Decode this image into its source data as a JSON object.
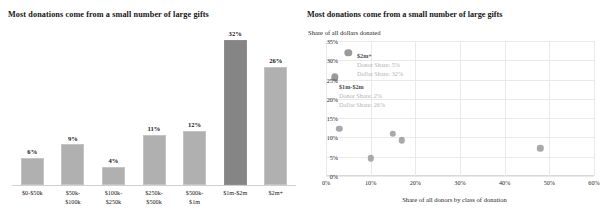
{
  "bar_panel": {
    "title": "Most donations come from a small number of large gifts"
  },
  "scatter_panel": {
    "title": "Most donations come from a small number of large gifts",
    "ylabel": "Share of all dollars donated",
    "xlabel": "Share of all donors by class of donation",
    "annotations": [
      {
        "header": "$2m+",
        "line1": "Donor Share: 5%",
        "line2": "Dollar Share: 32%"
      },
      {
        "header": "$1m-$2m",
        "line1": "Donor Share: 2%",
        "line2": "Dollar Share: 26%"
      }
    ]
  },
  "colors": {
    "bar_light": "#b0b0b0",
    "bar_dark": "#858585",
    "dot": "#a9a9a9",
    "grid": "#e9e9e9",
    "annotation_text": "#b4b4b4"
  },
  "chart_data": [
    {
      "type": "bar",
      "title": "Most donations come from a small number of large gifts",
      "xlabel": "",
      "ylabel": "",
      "categories": [
        "$0-$50k",
        "$50k-\n$100k",
        "$100k-\n$250k",
        "$250k-\n$500k",
        "$500k-\n$1m",
        "$1m-$2m",
        "$2m+"
      ],
      "values": [
        6,
        9,
        4,
        11,
        12,
        32,
        26
      ],
      "value_labels": [
        "6%",
        "9%",
        "4%",
        "11%",
        "12%",
        "32%",
        "26%"
      ],
      "highlighted_index": 5,
      "ylim": [
        0,
        35
      ],
      "grid": false,
      "legend": "none"
    },
    {
      "type": "scatter",
      "title": "Most donations come from a small number of large gifts",
      "xlabel": "Share of all donors by class of donation",
      "ylabel": "Share of all dollars donated",
      "xlim": [
        0,
        60
      ],
      "ylim": [
        0,
        35
      ],
      "xticks": [
        "0%",
        "10%",
        "20%",
        "30%",
        "40%",
        "50%",
        "60%"
      ],
      "xtick_values": [
        0,
        10,
        20,
        30,
        40,
        50,
        60
      ],
      "yticks": [
        "0%",
        "5%",
        "10%",
        "15%",
        "20%",
        "25%",
        "30%",
        "35%"
      ],
      "ytick_values": [
        0,
        5,
        10,
        15,
        20,
        25,
        30,
        35
      ],
      "grid": true,
      "legend": "none",
      "points": [
        {
          "label": "$2m+",
          "x": 5,
          "y": 32,
          "size": 7.4
        },
        {
          "label": "$1m-$2m",
          "x": 2,
          "y": 25.6,
          "size": 7.4
        },
        {
          "label": "$500k-$1m",
          "x": 3,
          "y": 12.3,
          "size": 6.4
        },
        {
          "label": "$250k-$500k",
          "x": 10,
          "y": 4.6,
          "size": 6.4
        },
        {
          "label": "$100k-$250k",
          "x": 15,
          "y": 11.0,
          "size": 6.4
        },
        {
          "label": "$50k-$100k",
          "x": 17,
          "y": 9.3,
          "size": 6.4
        },
        {
          "label": "$0-$50k",
          "x": 48,
          "y": 7.2,
          "size": 6.4
        }
      ]
    }
  ]
}
